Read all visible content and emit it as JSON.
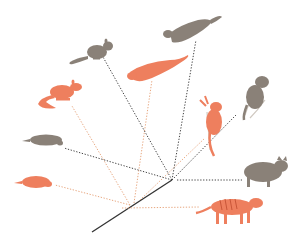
{
  "diagram": {
    "type": "phylogenetic-tree",
    "colors": {
      "gray_animal": "#8a8178",
      "orange_animal": "#ee7f5e",
      "gray_branch": "#444444",
      "orange_branch": "#e8a77f",
      "trunk": "#333333",
      "background": "#ffffff"
    },
    "root": {
      "trunk_start": [
        92,
        232
      ],
      "node": [
        172,
        180
      ]
    },
    "taxa": [
      {
        "id": "gray-jumping-rodent",
        "color_group": "gray",
        "position": [
          85,
          50
        ]
      },
      {
        "id": "gray-flying-squirrel",
        "color_group": "gray",
        "position": [
          215,
          30
        ]
      },
      {
        "id": "orange-sugar-glider",
        "color_group": "orange",
        "position": [
          155,
          75
        ]
      },
      {
        "id": "orange-rat",
        "color_group": "orange",
        "position": [
          60,
          95
        ]
      },
      {
        "id": "gray-lemur",
        "color_group": "gray",
        "position": [
          262,
          90
        ]
      },
      {
        "id": "orange-tree-kangaroo",
        "color_group": "orange",
        "position": [
          213,
          125
        ]
      },
      {
        "id": "gray-mole",
        "color_group": "gray",
        "position": [
          42,
          143
        ]
      },
      {
        "id": "orange-marsupial-mole",
        "color_group": "orange",
        "position": [
          35,
          183
        ]
      },
      {
        "id": "gray-wolf",
        "color_group": "gray",
        "position": [
          262,
          172
        ]
      },
      {
        "id": "orange-thylacine",
        "color_group": "orange",
        "position": [
          232,
          207
        ]
      }
    ],
    "caption": ""
  }
}
